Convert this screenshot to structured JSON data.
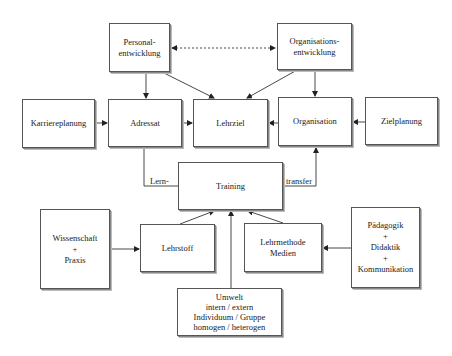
{
  "diagram": {
    "type": "flowchart",
    "nodes": {
      "personalentwicklung": {
        "lines": [
          "Personal-",
          "entwicklung"
        ]
      },
      "organisationsentwicklung": {
        "lines": [
          "Organisations-",
          "entwicklung"
        ]
      },
      "karriereplanung": {
        "lines": [
          "Karriereplanung"
        ]
      },
      "adressat": {
        "lines": [
          "Adressat"
        ]
      },
      "lehrziel": {
        "lines": [
          "Lehrziel"
        ]
      },
      "organisation": {
        "lines": [
          "Organisation"
        ]
      },
      "zielplanung": {
        "lines": [
          "Zielplanung"
        ]
      },
      "training": {
        "lines": [
          "Training"
        ]
      },
      "wissenschaft": {
        "lines": [
          "Wissenschaft",
          "+",
          "Praxis"
        ]
      },
      "lehrstoff": {
        "lines": [
          "Lehrstoff"
        ]
      },
      "lehrmethode": {
        "lines": [
          "Lehrmethode",
          "Medien"
        ]
      },
      "paedagogik": {
        "lines": [
          "Pädagogik",
          "+",
          "Didaktik",
          "+",
          "Kommunikation"
        ]
      },
      "umwelt": {
        "lines": [
          "Umwelt",
          "intern / extern",
          "Individuum / Gruppe",
          "homogen / heterogen"
        ]
      }
    },
    "edge_labels": {
      "lern": "Lern-",
      "transfer": "transfer"
    },
    "edges": [
      {
        "from": "personalentwicklung",
        "to": "organisationsentwicklung",
        "style": "dashed",
        "bidirectional": true
      },
      {
        "from": "personalentwicklung",
        "to": "adressat"
      },
      {
        "from": "personalentwicklung",
        "to": "lehrziel"
      },
      {
        "from": "organisationsentwicklung",
        "to": "lehrziel"
      },
      {
        "from": "organisationsentwicklung",
        "to": "organisation"
      },
      {
        "from": "karriereplanung",
        "to": "adressat"
      },
      {
        "from": "adressat",
        "to": "lehrziel"
      },
      {
        "from": "organisation",
        "to": "lehrziel"
      },
      {
        "from": "zielplanung",
        "to": "organisation"
      },
      {
        "from": "adressat",
        "to": "organisation",
        "via": "training",
        "label": "Lern- transfer"
      },
      {
        "from": "wissenschaft",
        "to": "lehrstoff"
      },
      {
        "from": "paedagogik",
        "to": "lehrmethode"
      },
      {
        "from": "lehrstoff",
        "to": "training"
      },
      {
        "from": "lehrmethode",
        "to": "training"
      },
      {
        "from": "umwelt",
        "to": "training"
      }
    ]
  }
}
